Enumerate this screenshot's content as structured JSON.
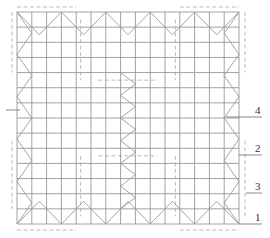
{
  "diagram": {
    "type": "structural-grid-plan",
    "colors": {
      "grid": "#8a8a8a",
      "dashed": "#a8a8a8",
      "label": "#333333"
    },
    "labels": [
      {
        "id": "label-4",
        "text": "4"
      },
      {
        "id": "label-2",
        "text": "2"
      },
      {
        "id": "label-3",
        "text": "3"
      },
      {
        "id": "label-1",
        "text": "1"
      }
    ]
  }
}
